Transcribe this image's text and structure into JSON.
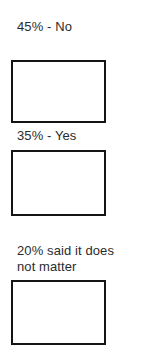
{
  "page": {
    "background_color": "#ffffff",
    "text_color": "#2b2b2b",
    "border_color": "#141414"
  },
  "groups": [
    {
      "id": "no",
      "label": "45% - No",
      "percent": "45%",
      "answer": "No"
    },
    {
      "id": "yes",
      "label": "35% - Yes",
      "percent": "35%",
      "answer": "Yes"
    },
    {
      "id": "nomatter",
      "label": "20% said it does\nnot matter",
      "percent": "20%",
      "answer": "said it does not matter"
    }
  ]
}
